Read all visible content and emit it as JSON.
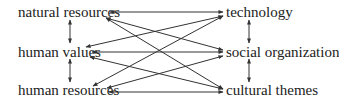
{
  "diagram": {
    "left_nodes": [
      {
        "id": "natural-resources",
        "label": "natural resources"
      },
      {
        "id": "human-values",
        "label": "human values"
      },
      {
        "id": "human-resources",
        "label": "human resources"
      }
    ],
    "right_nodes": [
      {
        "id": "technology",
        "label": "technology"
      },
      {
        "id": "social-organization",
        "label": "social organization"
      },
      {
        "id": "cultural-themes",
        "label": "cultural themes"
      }
    ],
    "edges": [
      {
        "from": "natural-resources",
        "to": "technology",
        "type": "bidirectional"
      },
      {
        "from": "natural-resources",
        "to": "social-organization",
        "type": "bidirectional"
      },
      {
        "from": "natural-resources",
        "to": "cultural-themes",
        "type": "bidirectional"
      },
      {
        "from": "human-values",
        "to": "technology",
        "type": "bidirectional"
      },
      {
        "from": "human-values",
        "to": "social-organization",
        "type": "bidirectional"
      },
      {
        "from": "human-values",
        "to": "cultural-themes",
        "type": "bidirectional"
      },
      {
        "from": "human-resources",
        "to": "technology",
        "type": "bidirectional"
      },
      {
        "from": "human-resources",
        "to": "social-organization",
        "type": "bidirectional"
      },
      {
        "from": "human-resources",
        "to": "cultural-themes",
        "type": "bidirectional"
      },
      {
        "from": "natural-resources",
        "to": "human-values",
        "type": "bidirectional"
      },
      {
        "from": "human-values",
        "to": "human-resources",
        "type": "bidirectional"
      },
      {
        "from": "technology",
        "to": "social-organization",
        "type": "bidirectional"
      },
      {
        "from": "social-organization",
        "to": "cultural-themes",
        "type": "bidirectional"
      }
    ],
    "colors": {
      "line": "#333333",
      "text": "#222222",
      "background": "#ffffff"
    }
  }
}
